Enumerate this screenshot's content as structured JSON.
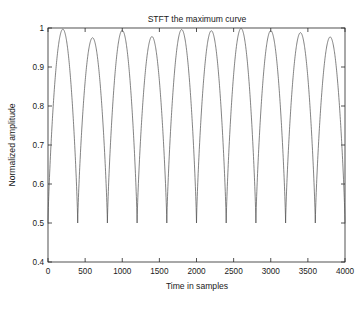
{
  "chart_data": {
    "type": "line",
    "title": "STFT the maximum curve",
    "xlabel": "Time in samples",
    "ylabel": "Normalized amplitude",
    "xlim": [
      0,
      4000
    ],
    "ylim": [
      0.4,
      1
    ],
    "grid": false,
    "legend": null,
    "line_color": "#4d4d4d",
    "background_color": "#ffffff",
    "xticks": [
      0,
      500,
      1000,
      1500,
      2000,
      2500,
      3000,
      3500,
      4000
    ],
    "xtick_labels": [
      "0",
      "500",
      "1000",
      "1500",
      "2000",
      "2500",
      "3000",
      "3500",
      "4000"
    ],
    "yticks": [
      0.4,
      0.5,
      0.6,
      0.7,
      0.8,
      0.9,
      1
    ],
    "ytick_labels": [
      "0.4",
      "0.5",
      "0.6",
      "0.7",
      "0.8",
      "0.9",
      "1"
    ],
    "series": [
      {
        "name": "STFT maximum",
        "description": "Rectified sinusoidal envelope, period 400 samples, troughs at 0.50, peaks near 1.0",
        "period": 400,
        "trough_value": 0.5,
        "peak_values": [
          0.997,
          0.975,
          0.994,
          0.978,
          0.996,
          0.993,
          0.999,
          0.993,
          0.988,
          0.977
        ],
        "peak_positions": [
          200,
          600,
          1000,
          1400,
          1800,
          2200,
          2600,
          3000,
          3400,
          3800
        ],
        "trough_positions": [
          400,
          800,
          1200,
          1600,
          2000,
          2400,
          2800,
          3200,
          3600
        ],
        "trough_values": [
          0.498,
          0.498,
          0.51,
          0.524,
          0.5,
          0.505,
          0.498,
          0.496,
          0.498
        ]
      }
    ]
  }
}
